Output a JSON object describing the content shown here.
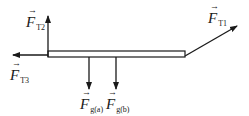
{
  "diagram": {
    "type": "free-body diagram",
    "beam": {
      "x1": 48,
      "y1": 51,
      "x2": 185,
      "y2": 57
    },
    "forces": [
      {
        "id": "T1",
        "symbol": "F",
        "subscript": "T1",
        "direction": "up-right",
        "from": [
          185,
          56
        ],
        "to": [
          237,
          26
        ]
      },
      {
        "id": "T2",
        "symbol": "F",
        "subscript": "T2",
        "direction": "up",
        "from": [
          48,
          56
        ],
        "to": [
          48,
          16
        ]
      },
      {
        "id": "T3",
        "symbol": "F",
        "subscript": "T3",
        "direction": "left",
        "from": [
          48,
          55
        ],
        "to": [
          13,
          55
        ]
      },
      {
        "id": "ga",
        "symbol": "F",
        "subscript": "g(a)",
        "direction": "down",
        "from": [
          89,
          57
        ],
        "to": [
          89,
          88
        ]
      },
      {
        "id": "gb",
        "symbol": "F",
        "subscript": "g(b)",
        "direction": "down",
        "from": [
          116,
          57
        ],
        "to": [
          116,
          88
        ]
      }
    ],
    "colors": {
      "stroke": "#1a1a1a",
      "background": "#ffffff"
    }
  },
  "labels": {
    "t1": {
      "F": "F",
      "sub": "T1"
    },
    "t2": {
      "F": "F",
      "sub": "T2"
    },
    "t3": {
      "F": "F",
      "sub": "T3"
    },
    "ga": {
      "F": "F",
      "sub": "g(a)"
    },
    "gb": {
      "F": "F",
      "sub": "g(b)"
    }
  }
}
